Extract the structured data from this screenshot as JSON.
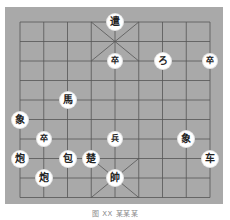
{
  "board": {
    "type": "xiangqi",
    "background_color": "#a9a9a9",
    "line_color": "#555555",
    "columns": 9,
    "rows": 10
  },
  "pieces": [
    {
      "glyph": "遣",
      "col": 4,
      "row": 0,
      "name": "general-piece-top",
      "size": "normal"
    },
    {
      "glyph": "卒",
      "col": 4,
      "row": 2,
      "name": "soldier-piece",
      "size": "small"
    },
    {
      "glyph": "ろ",
      "col": 6,
      "row": 2,
      "name": "elephant-piece-top",
      "size": "normal"
    },
    {
      "glyph": "卒",
      "col": 8,
      "row": 2,
      "name": "soldier-piece",
      "size": "small"
    },
    {
      "glyph": "馬",
      "col": 2,
      "row": 4,
      "name": "horse-piece",
      "size": "normal"
    },
    {
      "glyph": "象",
      "col": 0,
      "row": 5,
      "name": "elephant-piece",
      "size": "normal"
    },
    {
      "glyph": "卒",
      "col": 1,
      "row": 6,
      "name": "soldier-piece",
      "size": "small"
    },
    {
      "glyph": "兵",
      "col": 4,
      "row": 6,
      "name": "soldier-piece",
      "size": "small"
    },
    {
      "glyph": "象",
      "col": 7,
      "row": 6,
      "name": "elephant-piece",
      "size": "normal"
    },
    {
      "glyph": "炮",
      "col": 0,
      "row": 7,
      "name": "cannon-piece",
      "size": "normal"
    },
    {
      "glyph": "包",
      "col": 2,
      "row": 7,
      "name": "cannon-piece",
      "size": "normal"
    },
    {
      "glyph": "楚",
      "col": 3,
      "row": 7,
      "name": "chu-piece",
      "size": "normal"
    },
    {
      "glyph": "车",
      "col": 8,
      "row": 7,
      "name": "chariot-piece",
      "size": "normal"
    },
    {
      "glyph": "炮",
      "col": 1,
      "row": 8,
      "name": "cannon-piece",
      "size": "normal"
    },
    {
      "glyph": "帥",
      "col": 4,
      "row": 8,
      "name": "general-piece-bottom",
      "size": "normal"
    }
  ],
  "caption": "图 XX  某某某"
}
